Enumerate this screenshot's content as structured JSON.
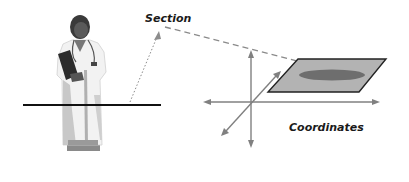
{
  "diagram": {
    "labels": {
      "section": "Section",
      "coordinates": "Coordinates"
    },
    "figure": {
      "description": "Doctor in white coat holding clipboard, stethoscope around neck",
      "icon": "doctor-figure"
    },
    "elements": {
      "section_line": "Horizontal cross-section line through figure",
      "projection": "Dashed line projecting the section onto a plane in 3D coordinates",
      "plane": "Shaded parallelogram plane with dark ellipse (cross-section)",
      "axes": [
        "x-axis",
        "y-axis",
        "z-axis"
      ]
    },
    "colors": {
      "plane_fill": "#b3b3b3",
      "plane_stroke": "#222222",
      "ellipse_fill": "#6e6e6e",
      "axis": "#808080",
      "section_line": "#111111",
      "dashed": "#8a8a8a",
      "coat": "#f2f2f2",
      "coat_shadow": "#bdbdbd",
      "hair": "#3a3a3a"
    }
  }
}
